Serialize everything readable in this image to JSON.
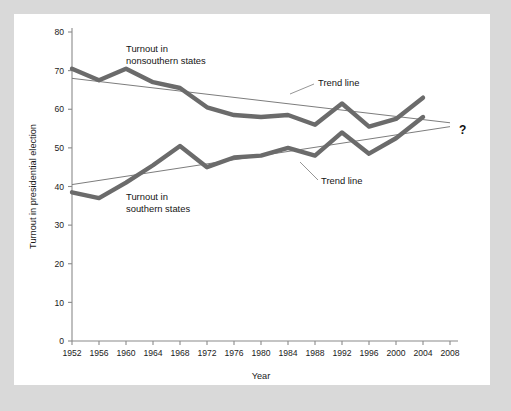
{
  "chart_data": {
    "type": "line",
    "title": "",
    "xlabel": "Year",
    "ylabel": "Turnout in presidential election",
    "xlim": [
      1952,
      2008
    ],
    "ylim": [
      0,
      80
    ],
    "grid": false,
    "legend_position": "inline-annotations",
    "x_ticks": [
      1952,
      1956,
      1960,
      1964,
      1968,
      1972,
      1976,
      1980,
      1984,
      1988,
      1992,
      1996,
      2000,
      2004,
      2008
    ],
    "y_ticks": [
      0,
      10,
      20,
      30,
      40,
      50,
      60,
      70,
      80
    ],
    "x": [
      1952,
      1956,
      1960,
      1964,
      1968,
      1972,
      1976,
      1980,
      1984,
      1988,
      1992,
      1996,
      2000,
      2004
    ],
    "series": [
      {
        "name": "Turnout in nonsouthern states",
        "values": [
          70.5,
          67.5,
          70.5,
          67.0,
          65.5,
          60.5,
          58.5,
          58.0,
          58.5,
          56.0,
          61.5,
          55.5,
          57.5,
          63.0
        ]
      },
      {
        "name": "Turnout in southern states",
        "values": [
          38.5,
          37.0,
          41.0,
          45.5,
          50.5,
          45.0,
          47.5,
          48.0,
          50.0,
          48.0,
          54.0,
          48.5,
          52.5,
          58.0
        ]
      }
    ],
    "trend_lines": [
      {
        "name": "Trend line (nonsouthern)",
        "x": [
          1952,
          2008
        ],
        "values": [
          68.0,
          56.5
        ]
      },
      {
        "name": "Trend line (southern)",
        "x": [
          1952,
          2008
        ],
        "values": [
          40.5,
          55.5
        ]
      }
    ],
    "annotations": [
      {
        "id": "label-nonsouthern",
        "text_line1": "Turnout in",
        "text_line2": "nonsouthern states"
      },
      {
        "id": "label-southern",
        "text_line1": "Turnout in",
        "text_line2": "southern states"
      },
      {
        "id": "trend-label-upper",
        "text": "Trend line"
      },
      {
        "id": "trend-label-lower",
        "text": "Trend line"
      },
      {
        "id": "future-unknown",
        "text": "?"
      }
    ]
  },
  "colors": {
    "page_background": "#d9d9d9",
    "panel_background": "#ffffff",
    "series_stroke": "#6b6b6b",
    "trend_stroke": "#7d7d7d",
    "axis_stroke": "#8a8a8a",
    "text": "#1b1b1b"
  }
}
